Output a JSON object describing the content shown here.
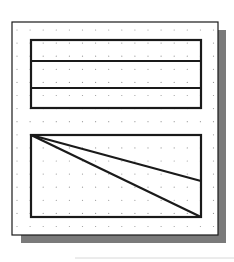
{
  "canvas": {
    "width": 234,
    "height": 262,
    "background": "#ffffff"
  },
  "colors": {
    "stroke": "#1a1a1a",
    "shadow": "#7a7a7a",
    "grid_dot": "#9a9a9a",
    "paper": "#ffffff",
    "baseline": "#d8d8d8"
  },
  "sheet": {
    "x": 12,
    "y": 22,
    "width": 206,
    "height": 213,
    "shadow_offset": 8
  },
  "grid": {
    "x0": 17,
    "y0": 30,
    "spacing": 13.1,
    "cols": 16,
    "rows": 16
  },
  "shapes": {
    "top_rectangle": {
      "x": 31,
      "y": 40,
      "width": 170,
      "height": 68,
      "dividers_y": [
        61,
        88
      ]
    },
    "bottom_rectangle": {
      "x": 31,
      "y": 135,
      "width": 170,
      "height": 82
    },
    "diagonals": [
      {
        "from": [
          31,
          135
        ],
        "to": [
          201,
          181
        ]
      },
      {
        "from": [
          31,
          135
        ],
        "to": [
          201,
          217
        ]
      }
    ]
  },
  "baseline": {
    "x1": 75,
    "x2": 234,
    "y": 258
  }
}
